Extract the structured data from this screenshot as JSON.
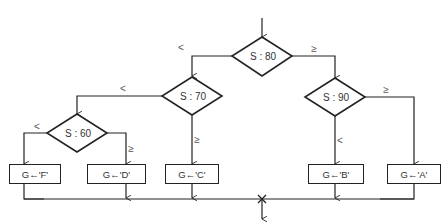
{
  "diagram": {
    "type": "flowchart",
    "colors": {
      "stroke": "#222222",
      "text": "#333333",
      "background": "#ffffff"
    },
    "decisions": [
      {
        "id": "d80",
        "label": "S : 80",
        "less_label": "<",
        "geq_label": "≥"
      },
      {
        "id": "d70",
        "label": "S : 70",
        "less_label": "<",
        "geq_label": "≥"
      },
      {
        "id": "d90",
        "label": "S : 90",
        "less_label": "<",
        "geq_label": "≥"
      },
      {
        "id": "d60",
        "label": "S : 60",
        "less_label": "<",
        "geq_label": "≥"
      }
    ],
    "processes": [
      {
        "id": "pF",
        "label": "G←'F'"
      },
      {
        "id": "pD",
        "label": "G←'D'"
      },
      {
        "id": "pC",
        "label": "G←'C'"
      },
      {
        "id": "pB",
        "label": "G←'B'"
      },
      {
        "id": "pA",
        "label": "G←'A'"
      }
    ],
    "edges": [
      {
        "from": "start",
        "to": "d80"
      },
      {
        "from": "d80",
        "to": "d70",
        "label": "<"
      },
      {
        "from": "d80",
        "to": "d90",
        "label": "≥"
      },
      {
        "from": "d70",
        "to": "d60",
        "label": "<"
      },
      {
        "from": "d70",
        "to": "pC",
        "label": "≥"
      },
      {
        "from": "d60",
        "to": "pF",
        "label": "<"
      },
      {
        "from": "d60",
        "to": "pD",
        "label": "≥"
      },
      {
        "from": "d90",
        "to": "pB",
        "label": "<"
      },
      {
        "from": "d90",
        "to": "pA",
        "label": "≥"
      },
      {
        "from": "pF",
        "to": "merge"
      },
      {
        "from": "pD",
        "to": "merge"
      },
      {
        "from": "pC",
        "to": "merge"
      },
      {
        "from": "pB",
        "to": "merge"
      },
      {
        "from": "pA",
        "to": "merge"
      },
      {
        "from": "merge",
        "to": "end"
      }
    ]
  }
}
